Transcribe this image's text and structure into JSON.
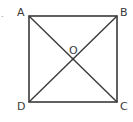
{
  "diagram": {
    "type": "square-with-diagonals",
    "prefix_mark": ".",
    "vertices": [
      {
        "label": "A",
        "x": 29,
        "y": 16
      },
      {
        "label": "B",
        "x": 117,
        "y": 16
      },
      {
        "label": "C",
        "x": 117,
        "y": 102
      },
      {
        "label": "D",
        "x": 29,
        "y": 102
      }
    ],
    "center": {
      "label": "O",
      "x": 73,
      "y": 59
    },
    "stroke_color": "#3a3a3a"
  }
}
